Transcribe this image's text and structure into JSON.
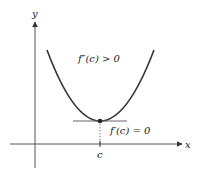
{
  "diagram": {
    "axes": {
      "x_label": "x",
      "y_label": "y"
    },
    "point_label": "c",
    "annotations": {
      "second_derivative": "f″(c) > 0",
      "first_derivative": "f′(c) = 0"
    },
    "colors": {
      "curve": "#333333",
      "axis": "#555555",
      "tangent": "#666666"
    }
  }
}
